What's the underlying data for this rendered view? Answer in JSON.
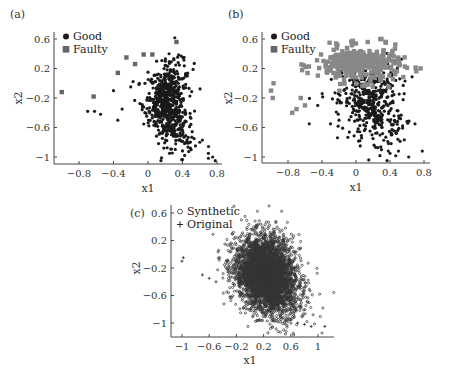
{
  "figure": {
    "panels": [
      {
        "label": "(a)",
        "xlabel": "x1",
        "ylabel": "x2",
        "xticks": [
          "-0.8",
          "-0.4",
          "0",
          "0.4",
          "0.8"
        ],
        "yticks": [
          "0.6",
          "0.2",
          "-0.2",
          "-0.6",
          "-1"
        ],
        "legend": [
          "Good",
          "Faulty"
        ]
      },
      {
        "label": "(b)",
        "xlabel": "x1",
        "ylabel": "x2",
        "xticks": [
          "-0.8",
          "-0.4",
          "0",
          "0.4",
          "0.8"
        ],
        "yticks": [
          "0.6",
          "0.2",
          "-0.2",
          "-0.6",
          "-1"
        ],
        "legend": [
          "Good",
          "Faulty"
        ]
      },
      {
        "label": "(c)",
        "xlabel": "x1",
        "ylabel": "x2",
        "xticks": [
          "-1",
          "-0.6",
          "-0.2",
          "0.2",
          "0.6",
          "1"
        ],
        "yticks": [
          "0.6",
          "0.2",
          "-0.2",
          "-0.6",
          "-1"
        ],
        "legend": [
          "Synthetic",
          "Original"
        ]
      }
    ]
  },
  "chart_data": [
    {
      "type": "scatter",
      "title": "(a)",
      "xlabel": "x1",
      "ylabel": "x2",
      "xlim": [
        -1.05,
        0.82
      ],
      "ylim": [
        -1.1,
        0.7
      ],
      "grid": false,
      "legend_position": "upper left",
      "series": [
        {
          "name": "Good",
          "marker": "circle",
          "color": "#1a1a1a",
          "cluster": {
            "center": [
              0.18,
              -0.3
            ],
            "spread": [
              0.12,
              0.28
            ],
            "count": 650
          },
          "points": [
            [
              -0.7,
              -0.38
            ],
            [
              -0.62,
              -0.38
            ],
            [
              -0.55,
              -0.42
            ],
            [
              -0.4,
              -0.1
            ],
            [
              -0.35,
              -0.5
            ],
            [
              -0.3,
              -0.35
            ],
            [
              -0.2,
              -0.05
            ],
            [
              -0.1,
              0.0
            ],
            [
              0.0,
              0.15
            ],
            [
              0.1,
              0.3
            ],
            [
              0.2,
              0.3
            ],
            [
              0.3,
              0.32
            ],
            [
              0.35,
              0.28
            ],
            [
              0.4,
              -0.7
            ],
            [
              0.45,
              -0.8
            ],
            [
              0.5,
              -0.9
            ],
            [
              0.55,
              -0.85
            ],
            [
              0.6,
              -0.8
            ],
            [
              0.7,
              -0.95
            ],
            [
              0.75,
              -1.0
            ],
            [
              0.78,
              -1.05
            ],
            [
              0.15,
              -1.05
            ],
            [
              0.25,
              -0.95
            ]
          ]
        },
        {
          "name": "Faulty",
          "marker": "square",
          "color": "#666666",
          "points": [
            [
              -1.0,
              -0.12
            ],
            [
              -0.63,
              -0.18
            ],
            [
              -0.35,
              0.14
            ],
            [
              -0.25,
              0.35
            ],
            [
              -0.15,
              0.26
            ],
            [
              -0.05,
              0.39
            ],
            [
              0.05,
              0.39
            ],
            [
              0.33,
              0.56
            ]
          ]
        }
      ]
    },
    {
      "type": "scatter",
      "title": "(b)",
      "xlabel": "x1",
      "ylabel": "x2",
      "xlim": [
        -1.05,
        0.82
      ],
      "ylim": [
        -1.1,
        0.7
      ],
      "grid": false,
      "legend_position": "upper left",
      "series": [
        {
          "name": "Good",
          "marker": "circle",
          "color": "#1a1a1a",
          "cluster": {
            "center": [
              0.12,
              -0.25
            ],
            "spread": [
              0.18,
              0.28
            ],
            "count": 450
          },
          "points": [
            [
              -0.55,
              -0.55
            ],
            [
              -0.45,
              -0.3
            ],
            [
              -0.3,
              -0.55
            ],
            [
              -0.2,
              -0.5
            ],
            [
              0.05,
              -0.85
            ],
            [
              0.2,
              -0.75
            ],
            [
              0.3,
              -0.9
            ],
            [
              0.4,
              -0.95
            ],
            [
              0.5,
              -0.92
            ],
            [
              0.62,
              -1.0
            ],
            [
              0.78,
              -0.92
            ],
            [
              0.45,
              0.3
            ]
          ]
        },
        {
          "name": "Faulty",
          "marker": "square",
          "color": "#888888",
          "cluster": {
            "center": [
              0.0,
              0.25
            ],
            "spread": [
              0.25,
              0.12
            ],
            "count": 300
          },
          "points": [
            [
              -1.0,
              -0.1
            ],
            [
              -0.98,
              -0.2
            ],
            [
              -0.97,
              0.0
            ],
            [
              -0.7,
              -0.35
            ],
            [
              -0.65,
              -0.2
            ],
            [
              -0.6,
              -0.3
            ],
            [
              -0.75,
              -0.4
            ],
            [
              -0.3,
              0.35
            ],
            [
              -0.1,
              0.4
            ],
            [
              0.3,
              0.6
            ],
            [
              0.35,
              0.55
            ]
          ]
        }
      ]
    },
    {
      "type": "scatter",
      "title": "(c)",
      "xlabel": "x1",
      "ylabel": "x2",
      "xlim": [
        -1.15,
        1.2
      ],
      "ylim": [
        -1.12,
        0.7
      ],
      "grid": false,
      "legend_position": "upper left",
      "series": [
        {
          "name": "Synthetic",
          "marker": "circle-open",
          "color": "#333333",
          "cluster": {
            "center": [
              0.2,
              -0.3
            ],
            "spread": [
              0.22,
              0.28
            ],
            "count": 4000
          }
        },
        {
          "name": "Original",
          "marker": "plus",
          "color": "#111111",
          "points": [
            [
              -1.0,
              -0.1
            ],
            [
              -0.98,
              -0.05
            ],
            [
              -0.7,
              -0.3
            ],
            [
              -0.6,
              -0.35
            ],
            [
              -0.5,
              -0.4
            ],
            [
              0.7,
              -1.0
            ],
            [
              0.8,
              -1.02
            ],
            [
              0.9,
              -1.05
            ],
            [
              1.1,
              -1.05
            ]
          ]
        }
      ]
    }
  ]
}
